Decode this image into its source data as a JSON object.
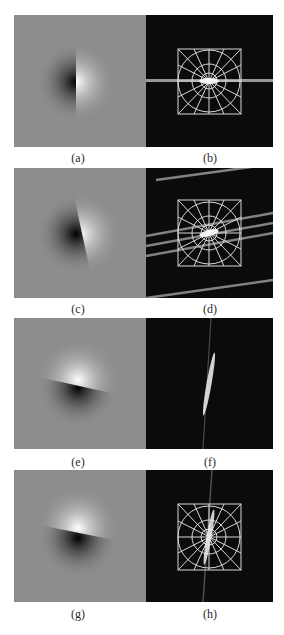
{
  "figure": {
    "rows": [
      {
        "left": {
          "caption": "(a)",
          "type": "spatial-gradient",
          "edge_angle_deg": 0,
          "dark_side": "left",
          "bright_side": "right"
        },
        "right": {
          "caption": "(b)",
          "type": "fourier-spectrum",
          "grid_overlay": true,
          "streak_angle_deg": 0
        }
      },
      {
        "left": {
          "caption": "(c)",
          "type": "spatial-gradient",
          "edge_angle_deg": 15,
          "dark_side": "left",
          "bright_side": "right"
        },
        "right": {
          "caption": "(d)",
          "type": "fourier-spectrum",
          "grid_overlay": true,
          "streak_angle_deg": -15
        }
      },
      {
        "left": {
          "caption": "(e)",
          "type": "spatial-gradient",
          "edge_angle_deg": 15,
          "dark_side": "bottom",
          "bright_side": "top"
        },
        "right": {
          "caption": "(f)",
          "type": "fourier-spectrum",
          "grid_overlay": false,
          "streak_angle_deg": 80
        }
      },
      {
        "left": {
          "caption": "(g)",
          "type": "spatial-gradient",
          "edge_angle_deg": 15,
          "dark_side": "bottom",
          "bright_side": "top"
        },
        "right": {
          "caption": "(h)",
          "type": "fourier-spectrum",
          "grid_overlay": true,
          "streak_angle_deg": 80
        }
      }
    ]
  },
  "colors": {
    "background": "#ffffff",
    "spatial_gray": "#8d8d8d",
    "spectrum_black": "#0b0b0b",
    "grid_line": "#d8d8d8"
  }
}
